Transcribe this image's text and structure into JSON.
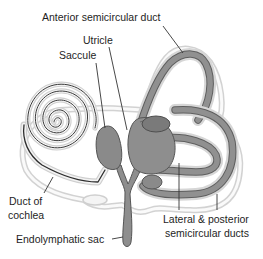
{
  "diagram": {
    "type": "anatomical-illustration",
    "colors": {
      "background": "#ffffff",
      "duct_fill": "#8c8c8c",
      "duct_dark": "#6e6e6e",
      "outer_outline": "#c8c8c8",
      "outline_light": "#e4e4e4",
      "leader_line": "#333333",
      "text": "#1e1e1e"
    },
    "labels": {
      "anterior": "Anterior semicircular duct",
      "utricle": "Utricle",
      "saccule": "Saccule",
      "cochlea_line1": "Duct of",
      "cochlea_line2": "cochlea",
      "endolymphatic": "Endolymphatic sac",
      "lateral_line1": "Lateral & posterior",
      "lateral_line2": "semicircular ducts"
    }
  }
}
